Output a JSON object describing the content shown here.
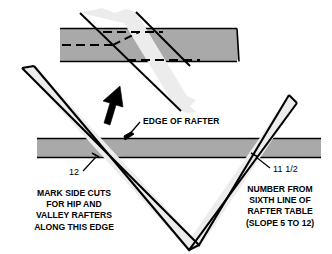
{
  "figure": {
    "colors": {
      "rafter_band_fill": "#a9a9a9",
      "square_blade_fill": "#ececec",
      "outline": "#000000",
      "background": "#ffffff",
      "arrow": "#000000"
    }
  },
  "labels": {
    "edge_of_rafter": "EDGE OF RAFTER",
    "dimension_left": "12",
    "dimension_right": "11 1/2"
  },
  "notes": {
    "left": {
      "lines": [
        "MARK SIDE CUTS",
        "FOR HIP AND",
        "VALLEY RAFTERS",
        "ALONG THIS EDGE"
      ]
    },
    "right": {
      "lines": [
        "NUMBER FROM",
        "SIXTH LINE OF",
        "RAFTER TABLE",
        "(SLOPE 5 TO 12)"
      ]
    }
  },
  "parts": {
    "top_rafter_band": "rafter-stock-top-view",
    "top_square_blade": "framing-square-blade-top",
    "bottom_rafter_band": "rafter-stock-edge-view",
    "framing_square": "framing-square-v-shape",
    "rotation_arrow": "rotate-arrow",
    "layout_lines": "dashed-layout-lines",
    "tick_left": "tick-mark-12",
    "tick_right": "tick-mark-11-half"
  }
}
